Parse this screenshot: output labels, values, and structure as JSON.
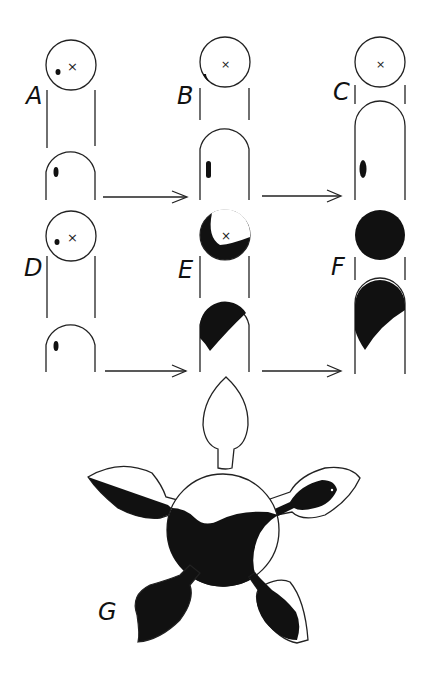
{
  "figure": {
    "panels": [
      {
        "id": "A",
        "label": "A",
        "state": "small dot in upper circle, small dot in lower column"
      },
      {
        "id": "B",
        "label": "B",
        "state": "dot at circle edge, elongated mark in column"
      },
      {
        "id": "C",
        "label": "C",
        "state": "upper circle empty, larger mark in taller column"
      },
      {
        "id": "D",
        "label": "D",
        "state": "small dot in upper circle, small dot in lower column"
      },
      {
        "id": "E",
        "label": "E",
        "state": "crescent fill in circle, partial fill in column"
      },
      {
        "id": "F",
        "label": "F",
        "state": "circle fully filled, column mostly filled"
      },
      {
        "id": "G",
        "label": "G",
        "state": "five-lobed shape with central disc partly filled"
      }
    ],
    "arrows": [
      {
        "from": "A",
        "to": "B"
      },
      {
        "from": "B",
        "to": "C"
      },
      {
        "from": "D",
        "to": "E"
      },
      {
        "from": "E",
        "to": "F"
      }
    ],
    "center_mark": "×",
    "colors": {
      "ink": "#111111",
      "paper": "#ffffff"
    }
  }
}
